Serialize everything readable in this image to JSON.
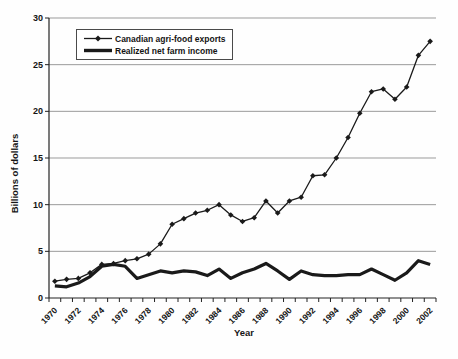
{
  "chart_data": {
    "type": "line",
    "title": "",
    "xlabel": "Year",
    "ylabel": "Billions of dollars",
    "x": [
      1970,
      1971,
      1972,
      1973,
      1974,
      1975,
      1976,
      1977,
      1978,
      1979,
      1980,
      1981,
      1982,
      1983,
      1984,
      1985,
      1986,
      1987,
      1988,
      1989,
      1990,
      1991,
      1992,
      1993,
      1994,
      1995,
      1996,
      1997,
      1998,
      1999,
      2000,
      2001,
      2002
    ],
    "xticks": [
      1970,
      1972,
      1974,
      1976,
      1978,
      1980,
      1982,
      1984,
      1986,
      1988,
      1990,
      1992,
      1994,
      1996,
      1998,
      2000,
      2002
    ],
    "yticks": [
      0,
      5,
      10,
      15,
      20,
      25,
      30
    ],
    "ylim": [
      0,
      30
    ],
    "grid": "horizontal",
    "legend_position": "top-left-inside",
    "series": [
      {
        "name": "Canadian agri-food exports",
        "marker": "diamond",
        "line_width": 1.3,
        "values": [
          1.8,
          2.0,
          2.1,
          2.7,
          3.6,
          3.7,
          4.0,
          4.2,
          4.7,
          5.8,
          7.9,
          8.5,
          9.1,
          9.4,
          10.0,
          8.9,
          8.2,
          8.6,
          10.4,
          9.1,
          10.4,
          10.8,
          13.1,
          13.2,
          15.0,
          17.2,
          19.8,
          22.1,
          22.4,
          21.3,
          22.6,
          26.0,
          27.5
        ]
      },
      {
        "name": "Realized net farm income",
        "marker": "none",
        "line_width": 3.2,
        "values": [
          1.3,
          1.2,
          1.6,
          2.3,
          3.4,
          3.6,
          3.4,
          2.1,
          2.5,
          2.9,
          2.7,
          2.9,
          2.8,
          2.4,
          3.1,
          2.1,
          2.7,
          3.1,
          3.7,
          2.9,
          2.0,
          2.9,
          2.5,
          2.4,
          2.4,
          2.5,
          2.5,
          3.1,
          2.5,
          1.9,
          2.7,
          4.0,
          3.6
        ]
      }
    ],
    "colors": {
      "series": "#1a1a1a",
      "grid": "#9b9b9b",
      "axis": "#222222",
      "background": "#ffffff"
    }
  }
}
